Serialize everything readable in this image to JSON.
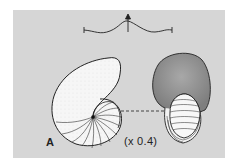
{
  "figure": {
    "panel_label": "A",
    "scale_text": "(x 0.4)",
    "colors": {
      "background": "#ffffff",
      "panel": "#d6d6d6",
      "shell_fill": "#f4f4f4",
      "shaded_fill": "#9a9a9a",
      "line": "#2a2a2a"
    }
  }
}
